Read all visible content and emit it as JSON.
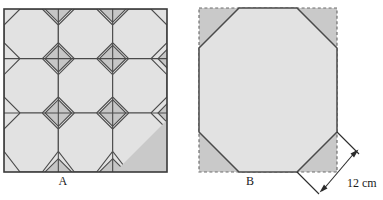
{
  "figure_a": {
    "label": "A",
    "shape": "square-tiling-of-octagons-and-diamonds",
    "grid": 3,
    "square": {
      "x": 4,
      "y": 9,
      "size": 163
    },
    "colors": {
      "octagon_fill": "#e2e2e2",
      "diamond_fill": "#c6c6c6",
      "corner_triangle_fill": "#c9c9c9",
      "outline": "#4a4a4a",
      "border": "#3a3a3a"
    }
  },
  "figure_b": {
    "label": "B",
    "shape": "regular-octagon-inscribed-in-square",
    "square": {
      "x": 199,
      "y": 8,
      "size": 138
    },
    "dimension": {
      "value": "12 cm",
      "applies_to": "octagon-side-lower-right-cut",
      "arrow": "double-headed"
    },
    "colors": {
      "octagon_fill": "#e2e2e2",
      "corner_fill": "#c9c9c9",
      "outline": "#4a4a4a",
      "dashed_border": "#6e6e6e",
      "arrow": "#2b2b2b"
    }
  }
}
